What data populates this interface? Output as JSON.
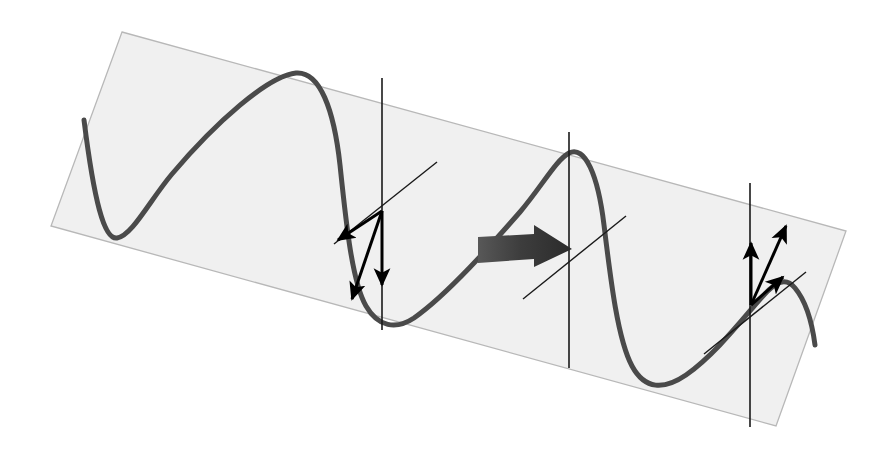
{
  "figure": {
    "background_color": "#ffffff",
    "caption": ""
  },
  "plane": {
    "name": "inclined reference plane",
    "fill_color": "#f0f0f0",
    "stroke_color": "#b8b8b8",
    "opacity": 1,
    "corners": [
      {
        "label": "top-left",
        "x": 122,
        "y": 32
      },
      {
        "label": "top-right",
        "x": 846,
        "y": 231
      },
      {
        "label": "bottom-right",
        "x": 776,
        "y": 426
      },
      {
        "label": "bottom-left",
        "x": 51,
        "y": 226
      }
    ]
  },
  "wave": {
    "name": "sinusoidal waveform",
    "stroke_color": "#4a4a4a",
    "stroke_width": 5,
    "cycles": 2,
    "description": "two-cycle transverse sine wave drawn in perspective across the plane",
    "path": "M 84 120 C 94 200, 104 240, 117 238 C 132 236, 150 200, 172 174 C 216 122, 268 76, 296 73 C 320 71, 334 110, 340 165 C 346 222, 352 282, 366 306 C 378 327, 396 330, 414 318 C 448 294, 492 244, 520 212 C 542 186, 556 160, 569 153 C 585 145, 598 175, 604 225 C 611 283, 618 340, 632 366 C 645 390, 664 390, 686 375 C 716 354, 744 317, 762 297 C 776 281, 786 277, 795 288 C 805 300, 812 322, 815 345"
  },
  "vertical_lines": [
    {
      "name": "phase-marker-1",
      "x": 382,
      "y_top": 78,
      "y_bottom": 330,
      "stroke_color": "#1a1a1a",
      "stroke_width": 1.6
    },
    {
      "name": "phase-marker-2",
      "x": 569,
      "y_top": 132,
      "y_bottom": 368,
      "stroke_color": "#1a1a1a",
      "stroke_width": 1.6
    },
    {
      "name": "phase-marker-3",
      "x": 750,
      "y_top": 183,
      "y_bottom": 427,
      "stroke_color": "#1a1a1a",
      "stroke_width": 1.6
    }
  ],
  "reference_axes": [
    {
      "name": "in-plane-axis-left",
      "x1": 334,
      "y1": 244,
      "x2": 437,
      "y2": 162,
      "stroke_color": "#1a1a1a",
      "stroke_width": 1.4,
      "note": "thin guide line through first vector origin, parallel to plane"
    },
    {
      "name": "in-plane-axis-middle",
      "x1": 523,
      "y1": 299,
      "x2": 626,
      "y2": 216,
      "stroke_color": "#1a1a1a",
      "stroke_width": 1.4,
      "note": "thin guide line through second phase marker, parallel to plane"
    },
    {
      "name": "in-plane-axis-right",
      "x1": 704,
      "y1": 354,
      "x2": 806,
      "y2": 272,
      "stroke_color": "#1a1a1a",
      "stroke_width": 1.4,
      "note": "thin guide line through second vector origin, parallel to plane"
    }
  ],
  "vector_groups": [
    {
      "name": "downward-vector-triad",
      "position": "first marker, descending part of the wave",
      "origin": {
        "x": 382,
        "y": 211
      },
      "arrow_color": "#000000",
      "stroke_width": 3,
      "direction_sense": "downward",
      "arrows": [
        {
          "name": "vector-vertical-down",
          "tip_x": 382,
          "tip_y": 285,
          "label": "",
          "note": "vertical component pointing down"
        },
        {
          "name": "vector-oblique-down-left-shallow",
          "tip_x": 338,
          "tip_y": 240,
          "label": "",
          "note": "shallow oblique component toward lower-left"
        },
        {
          "name": "vector-oblique-down-left-steep",
          "tip_x": 352,
          "tip_y": 299,
          "label": "",
          "note": "steep oblique component toward lower-left"
        }
      ]
    },
    {
      "name": "upward-vector-triad",
      "position": "third marker, ascending part of the wave",
      "origin": {
        "x": 751,
        "y": 305
      },
      "arrow_color": "#000000",
      "stroke_width": 3,
      "direction_sense": "upward",
      "arrows": [
        {
          "name": "vector-vertical-up",
          "tip_x": 751,
          "tip_y": 243,
          "label": "",
          "note": "vertical component pointing up"
        },
        {
          "name": "vector-oblique-up-right-steep",
          "tip_x": 786,
          "tip_y": 226,
          "label": "",
          "note": "steep oblique component toward upper-right"
        },
        {
          "name": "vector-oblique-up-right-shallow",
          "tip_x": 783,
          "tip_y": 277,
          "label": "",
          "note": "shallow oblique component toward upper-right"
        }
      ]
    }
  ],
  "propagation_arrow": {
    "name": "wave propagation direction arrow",
    "fill_color": "#3d3d3d",
    "direction": "right",
    "label": "",
    "tail_x": 478,
    "tip_x": 572,
    "center_y": 247,
    "shaft_half_height": 12,
    "head_half_height": 22
  },
  "legend": {
    "visible": false,
    "entries": []
  },
  "chart_data": {
    "type": "line",
    "title": "",
    "xlabel": "",
    "ylabel": "",
    "series": [
      {
        "name": "transverse wave",
        "description": "sinusoidal displacement drawn in oblique projection over an inclined plane",
        "cycles": 2,
        "points_px": [
          [
            84,
            120
          ],
          [
            117,
            238
          ],
          [
            172,
            174
          ],
          [
            296,
            73
          ],
          [
            340,
            165
          ],
          [
            366,
            306
          ],
          [
            414,
            318
          ],
          [
            520,
            212
          ],
          [
            569,
            153
          ],
          [
            604,
            225
          ],
          [
            632,
            366
          ],
          [
            686,
            375
          ],
          [
            762,
            297
          ],
          [
            795,
            288
          ],
          [
            815,
            345
          ]
        ]
      }
    ],
    "annotations": [
      {
        "name": "phase-marker-1",
        "x_px": 382,
        "text": ""
      },
      {
        "name": "phase-marker-2",
        "x_px": 569,
        "text": ""
      },
      {
        "name": "phase-marker-3",
        "x_px": 750,
        "text": ""
      },
      {
        "name": "propagation-arrow",
        "x_px": 525,
        "text": ""
      }
    ],
    "grid": false,
    "legend_position": "none"
  }
}
